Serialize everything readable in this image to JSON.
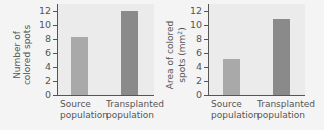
{
  "colors": {
    "page_background": "#f4f4f4",
    "plot_background": "#ebebeb",
    "source_bar": "#a9a9a9",
    "transplanted_bar": "#8a8a8a",
    "axis": "#555555"
  },
  "chart_data": [
    {
      "type": "bar",
      "title": "",
      "categories": [
        "Source population",
        "Transplanted population"
      ],
      "values": [
        8.3,
        12
      ],
      "xlabel": "",
      "ylabel": "Number of colored spots",
      "ylim": [
        0,
        13
      ],
      "yticks": [
        0,
        2,
        4,
        6,
        8,
        10,
        12
      ],
      "grid": false,
      "legend": null
    },
    {
      "type": "bar",
      "title": "",
      "categories": [
        "Source population",
        "Transplanted population"
      ],
      "values": [
        5.2,
        10.8
      ],
      "xlabel": "",
      "ylabel": "Area of colored spots (mm²)",
      "ylim": [
        0,
        13
      ],
      "yticks": [
        0,
        2,
        4,
        6,
        8,
        10,
        12
      ],
      "grid": false,
      "legend": null
    }
  ],
  "left": {
    "ylabel_line1": "Number of",
    "ylabel_line2": "colored spots",
    "xlabels": [
      {
        "line1": "Source",
        "line2": "population"
      },
      {
        "line1": "Transplanted",
        "line2": "population"
      }
    ]
  },
  "right": {
    "ylabel_line1": "Area of colored",
    "ylabel_line2": "spots (mm",
    "ylabel_sup": "2",
    "ylabel_close": ")",
    "xlabels": [
      {
        "line1": "Source",
        "line2": "population"
      },
      {
        "line1": "Transplanted",
        "line2": "population"
      }
    ]
  }
}
